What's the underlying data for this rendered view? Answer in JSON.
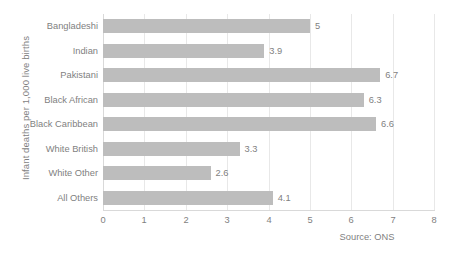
{
  "chart_data": {
    "type": "bar",
    "orientation": "horizontal",
    "title": "",
    "subtitle": "",
    "xlabel": "",
    "ylabel": "Infant deaths per 1,000 live births",
    "categories": [
      "Bangladeshi",
      "Indian",
      "Pakistani",
      "Black African",
      "Black Caribbean",
      "White British",
      "White Other",
      "All Others"
    ],
    "values": [
      5,
      3.9,
      6.7,
      6.3,
      6.6,
      3.3,
      2.6,
      4.1
    ],
    "data_labels": [
      "5",
      "3.9",
      "6.7",
      "6.3",
      "6.6",
      "3.3",
      "2.6",
      "4.1"
    ],
    "xlim": [
      0,
      8
    ],
    "xticks": [
      0,
      1,
      2,
      3,
      4,
      5,
      6,
      7,
      8
    ],
    "xtick_labels": [
      "0",
      "1",
      "2",
      "3",
      "4",
      "5",
      "6",
      "7",
      "8"
    ],
    "grid": "vertical",
    "legend": "none",
    "annotations": [
      "Source: ONS"
    ],
    "series": [
      {
        "name": "Infant mortality rate",
        "values": [
          5,
          3.9,
          6.7,
          6.3,
          6.6,
          3.3,
          2.6,
          4.1
        ],
        "color": "#bdbdbd"
      }
    ]
  },
  "footer": {
    "source": "Source: ONS"
  },
  "colors": {
    "bar": "#bdbdbd",
    "text": "#7f7f7f",
    "gridline": "#e8e8e8",
    "axis": "#d9d9d9",
    "background": "#ffffff"
  }
}
